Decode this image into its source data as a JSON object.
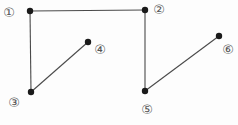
{
  "diagram": {
    "canvas": {
      "width": 238,
      "height": 125,
      "background": "#fdfdfd"
    },
    "style": {
      "edge_color": "#4a4a4a",
      "edge_width": 1.1,
      "dot_color": "#1a1a1a",
      "dot_radius": 3.2,
      "label_color": "#555555",
      "label_font_size": 13
    },
    "points": [
      {
        "id": 1,
        "label": "①",
        "x": 30,
        "y": 11,
        "label_x": 9,
        "label_y": 12
      },
      {
        "id": 2,
        "label": "②",
        "x": 145,
        "y": 10,
        "label_x": 159,
        "label_y": 9
      },
      {
        "id": 3,
        "label": "③",
        "x": 31,
        "y": 92,
        "label_x": 14,
        "label_y": 102
      },
      {
        "id": 4,
        "label": "④",
        "x": 88,
        "y": 42,
        "label_x": 100,
        "label_y": 49
      },
      {
        "id": 5,
        "label": "⑤",
        "x": 145,
        "y": 91,
        "label_x": 147,
        "label_y": 109
      },
      {
        "id": 6,
        "label": "⑥",
        "x": 219,
        "y": 36,
        "label_x": 228,
        "label_y": 49
      }
    ],
    "edges": [
      {
        "from": 1,
        "to": 2
      },
      {
        "from": 1,
        "to": 3
      },
      {
        "from": 3,
        "to": 4
      },
      {
        "from": 2,
        "to": 5
      },
      {
        "from": 5,
        "to": 6
      }
    ]
  }
}
